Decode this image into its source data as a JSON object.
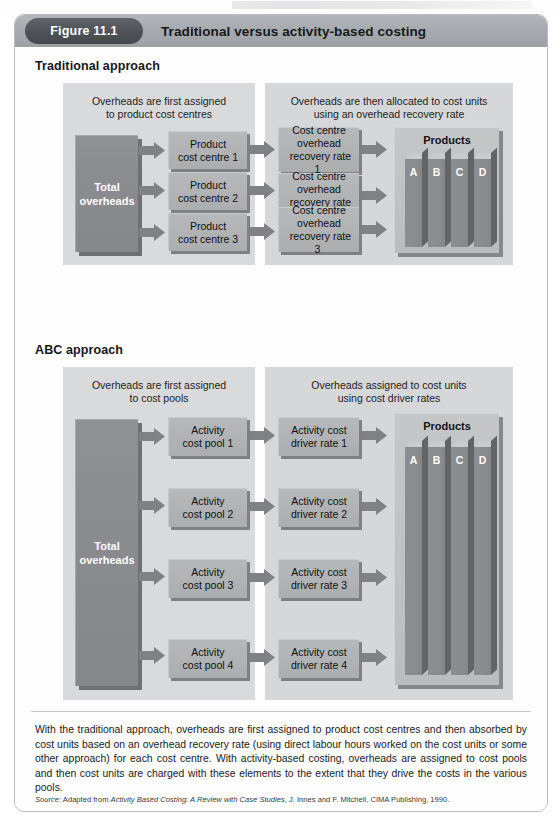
{
  "figure": {
    "number_label": "Figure 11.1",
    "title": "Traditional versus activity-based costing"
  },
  "sections": [
    {
      "heading": "Traditional approach",
      "left_panel_caption_line1": "Overheads are first assigned",
      "left_panel_caption_line2": "to product cost centres",
      "right_panel_caption_line1": "Overheads are then allocated to cost units",
      "right_panel_caption_line2": "using an overhead recovery rate",
      "source_box": "Total\noverheads",
      "source_box_line1": "Total",
      "source_box_line2": "overheads",
      "middle_boxes": [
        "Product\ncost centre 1",
        "Product\ncost centre 2",
        "Product\ncost centre 3"
      ],
      "middle_boxes_lines": [
        [
          "Product",
          "cost centre 1"
        ],
        [
          "Product",
          "cost centre 2"
        ],
        [
          "Product",
          "cost centre 3"
        ]
      ],
      "rate_boxes_lines": [
        [
          "Cost centre",
          "overhead",
          "recovery rate 1"
        ],
        [
          "Cost centre",
          "overhead",
          "recovery rate 2"
        ],
        [
          "Cost centre",
          "overhead",
          "recovery rate 3"
        ]
      ],
      "products_title": "Products",
      "product_labels": [
        "A",
        "B",
        "C",
        "D"
      ]
    },
    {
      "heading": "ABC approach",
      "left_panel_caption_line1": "Overheads are first assigned",
      "left_panel_caption_line2": "to cost pools",
      "right_panel_caption_line1": "Overheads assigned to cost units",
      "right_panel_caption_line2": "using cost driver rates",
      "source_box_line1": "Total",
      "source_box_line2": "overheads",
      "middle_boxes_lines": [
        [
          "Activity",
          "cost pool 1"
        ],
        [
          "Activity",
          "cost pool 2"
        ],
        [
          "Activity",
          "cost pool 3"
        ],
        [
          "Activity",
          "cost pool 4"
        ]
      ],
      "rate_boxes_lines": [
        [
          "Activity cost",
          "driver rate 1"
        ],
        [
          "Activity cost",
          "driver rate 2"
        ],
        [
          "Activity cost",
          "driver rate 3"
        ],
        [
          "Activity cost",
          "driver rate 4"
        ]
      ],
      "products_title": "Products",
      "product_labels": [
        "A",
        "B",
        "C",
        "D"
      ]
    }
  ],
  "caption": {
    "text": "With the traditional approach, overheads are first assigned to product cost centres and then absorbed by cost units based on an overhead recovery rate (using direct labour hours worked on the cost units or some other approach) for each cost centre. With activity-based costing, overheads are assigned to cost pools and then cost units are charged with these elements to the extent that they drive the costs in the various pools."
  },
  "source": {
    "prefix": "Source:",
    "adapted": " Adapted from ",
    "work_title": "Activity Based Costing: A Review with Case Studies",
    "rest": ", J. Innes and F. Mitchell, CIMA Publishing, 1990."
  },
  "colors": {
    "title_bar": "#a7aaae",
    "pill": "#4e5155",
    "panel": "#d9dadc",
    "dark_block": "#898b8e",
    "process_box": "#b0b2b4",
    "arrow": "#7f8184",
    "card_border": "#b9bcc0"
  }
}
